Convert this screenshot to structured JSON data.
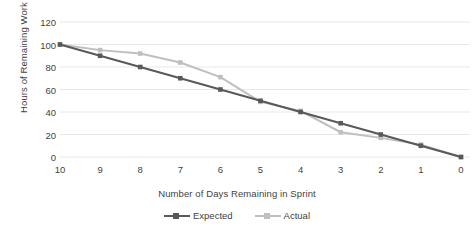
{
  "chart_data": {
    "type": "line",
    "title": "",
    "xlabel": "Number of Days Remaining in Sprint",
    "ylabel": "Hours of Remaining Work",
    "categories": [
      "10",
      "9",
      "8",
      "7",
      "6",
      "5",
      "4",
      "3",
      "2",
      "1",
      "0"
    ],
    "x": [
      10,
      9,
      8,
      7,
      6,
      5,
      4,
      3,
      2,
      1,
      0
    ],
    "xlim": [
      10,
      0
    ],
    "ylim": [
      0,
      120
    ],
    "yticks": [
      0,
      20,
      40,
      60,
      80,
      100,
      120
    ],
    "ytick_labels": [
      "0",
      "20",
      "40",
      "60",
      "80",
      "100",
      "120"
    ],
    "grid": "horizontal",
    "legend_position": "bottom",
    "series": [
      {
        "name": "Expected",
        "color": "#595959",
        "marker": "square",
        "values": [
          100,
          90,
          80,
          70,
          60,
          50,
          40,
          30,
          20,
          10,
          0
        ]
      },
      {
        "name": "Actual",
        "color": "#bfbfbf",
        "marker": "square",
        "values": [
          100,
          95,
          92,
          84,
          71,
          49,
          41,
          22,
          17,
          11,
          0
        ]
      }
    ]
  },
  "axes": {
    "y_title": "Hours of Remaining Work",
    "x_title": "Number of Days Remaining in Sprint"
  },
  "legend": {
    "items": [
      {
        "label": "Expected",
        "color": "#595959"
      },
      {
        "label": "Actual",
        "color": "#bfbfbf"
      }
    ]
  },
  "colors": {
    "background": "#ffffff",
    "gridline": "#e8e8e8",
    "text": "#3f3f3f",
    "expected": "#595959",
    "actual": "#bfbfbf"
  }
}
